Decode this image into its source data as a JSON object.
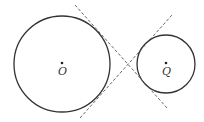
{
  "diagram": {
    "type": "two circles with common internal tangents",
    "circles": [
      {
        "id": "O",
        "label": "O",
        "cx": 62,
        "cy": 64,
        "r": 48,
        "center_dot": true
      },
      {
        "id": "Q",
        "label": "Q",
        "cx": 166,
        "cy": 64,
        "r": 29,
        "center_dot": true
      }
    ],
    "tangent_lines": [
      {
        "id": "tangent-1",
        "style": "dashed",
        "x1": 75,
        "y1": 5,
        "x2": 167,
        "y2": 108
      },
      {
        "id": "tangent-2",
        "style": "dashed",
        "x1": 80,
        "y1": 118,
        "x2": 172,
        "y2": 15
      }
    ],
    "colors": {
      "stroke": "#333333",
      "dash": "#555555",
      "background": "#ffffff"
    }
  }
}
